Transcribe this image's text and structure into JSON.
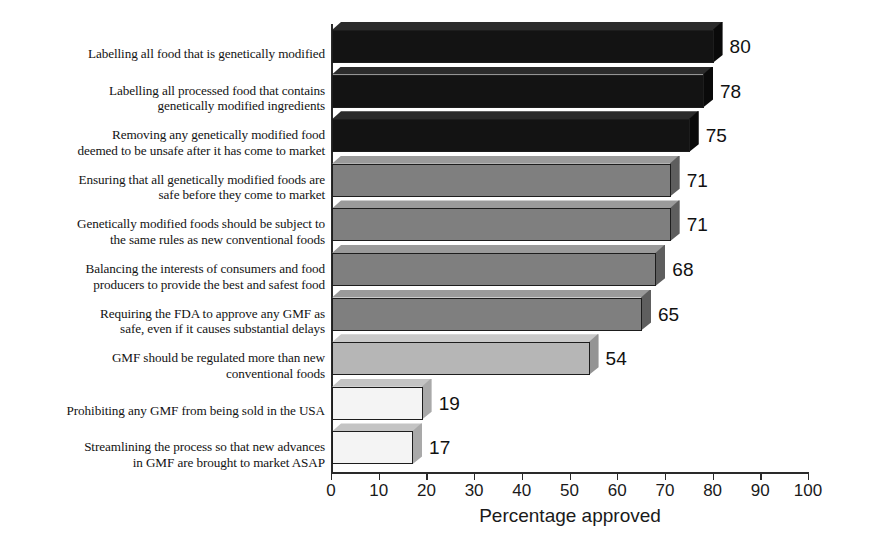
{
  "chart_data": {
    "type": "bar",
    "orientation": "horizontal",
    "title": "",
    "subtitle": "",
    "xlabel": "Percentage approved",
    "ylabel": "",
    "xlim": [
      0,
      100
    ],
    "xticks": [
      0,
      10,
      20,
      30,
      40,
      50,
      60,
      70,
      80,
      90,
      100
    ],
    "xtick_labels": [
      "0",
      "10",
      "20",
      "30",
      "40",
      "50",
      "60",
      "70",
      "80",
      "90",
      "100"
    ],
    "grid": false,
    "legend": null,
    "style": "3d-horizontal-bar",
    "categories": [
      "Labelling all food that is genetically modified",
      "Labelling all processed food that contains genetically modified ingredients",
      "Removing any genetically modified food deemed to be unsafe after it has come to market",
      "Ensuring that all genetically modified foods are safe before they come to market",
      "Genetically modified foods should be subject to the same rules as new conventional foods",
      "Balancing the interests of consumers and food producers to provide the best and safest food",
      "Requiring the FDA to approve any GMF as safe, even if it causes substantial delays",
      "GMF should be regulated more than new conventional foods",
      "Prohibiting any GMF from being sold in the USA",
      "Streamlining the process so that new advances in GMF are brought to market ASAP"
    ],
    "values": [
      80,
      78,
      75,
      71,
      71,
      68,
      65,
      54,
      19,
      17
    ],
    "value_labels": [
      "80",
      "78",
      "75",
      "71",
      "71",
      "68",
      "65",
      "54",
      "19",
      "17"
    ],
    "bar_colors": [
      "#121212",
      "#121212",
      "#121212",
      "#7d7d7d",
      "#7d7d7d",
      "#7d7d7d",
      "#7d7d7d",
      "#b4b4b4",
      "#f2f2f2",
      "#f2f2f2"
    ]
  },
  "bars": [
    {
      "label_lines": [
        "Labelling all food that is genetically modified"
      ],
      "value": 80,
      "value_text": "80",
      "front_color": "#131313",
      "top_color": "#2b2b2b",
      "side_color": "#0a0a0a"
    },
    {
      "label_lines": [
        "Labelling all processed food that contains",
        "genetically modified ingredients"
      ],
      "value": 78,
      "value_text": "78",
      "front_color": "#131313",
      "top_color": "#2b2b2b",
      "side_color": "#0a0a0a"
    },
    {
      "label_lines": [
        "Removing any genetically modified food",
        "deemed to be unsafe after it has come to market"
      ],
      "value": 75,
      "value_text": "75",
      "front_color": "#131313",
      "top_color": "#2b2b2b",
      "side_color": "#0a0a0a"
    },
    {
      "label_lines": [
        "Ensuring that all genetically modified foods are",
        "safe before they come to market"
      ],
      "value": 71,
      "value_text": "71",
      "front_color": "#7f7f7f",
      "top_color": "#9a9a9a",
      "side_color": "#5e5e5e"
    },
    {
      "label_lines": [
        "Genetically modified foods should be subject to",
        "the same rules as new conventional foods"
      ],
      "value": 71,
      "value_text": "71",
      "front_color": "#7f7f7f",
      "top_color": "#9a9a9a",
      "side_color": "#5e5e5e"
    },
    {
      "label_lines": [
        "Balancing the interests of consumers and food",
        "producers to provide the best and safest food"
      ],
      "value": 68,
      "value_text": "68",
      "front_color": "#7f7f7f",
      "top_color": "#9a9a9a",
      "side_color": "#5e5e5e"
    },
    {
      "label_lines": [
        "Requiring the FDA to approve any GMF as",
        "safe, even if it causes substantial delays"
      ],
      "value": 65,
      "value_text": "65",
      "front_color": "#7f7f7f",
      "top_color": "#9a9a9a",
      "side_color": "#5e5e5e"
    },
    {
      "label_lines": [
        "GMF should be regulated more than new",
        "conventional foods"
      ],
      "value": 54,
      "value_text": "54",
      "front_color": "#b6b6b6",
      "top_color": "#c9c9c9",
      "side_color": "#949494"
    },
    {
      "label_lines": [
        "Prohibiting any GMF from being sold in the USA"
      ],
      "value": 19,
      "value_text": "19",
      "front_color": "#f4f4f4",
      "top_color": "#c4c4c4",
      "side_color": "#a9a9a9"
    },
    {
      "label_lines": [
        "Streamlining the process so that new advances",
        "in GMF are brought to market ASAP"
      ],
      "value": 17,
      "value_text": "17",
      "front_color": "#f4f4f4",
      "top_color": "#c4c4c4",
      "side_color": "#a9a9a9"
    }
  ],
  "axis": {
    "x_label": "Percentage approved",
    "tick_labels": [
      "0",
      "10",
      "20",
      "30",
      "40",
      "50",
      "60",
      "70",
      "80",
      "90",
      "100"
    ]
  }
}
